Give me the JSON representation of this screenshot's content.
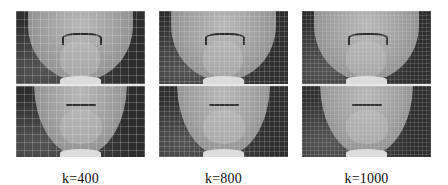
{
  "figure": {
    "panels": [
      {
        "label": "k=400",
        "k": 400,
        "grid_cell_px": 8,
        "image": "face-mesh-top-and-bottom-views"
      },
      {
        "label": "k=800",
        "k": 800,
        "grid_cell_px": 5,
        "image": "face-mesh-top-and-bottom-views"
      },
      {
        "label": "k=1000",
        "k": 1000,
        "grid_cell_px": 4,
        "image": "face-mesh-top-and-bottom-views"
      }
    ]
  }
}
